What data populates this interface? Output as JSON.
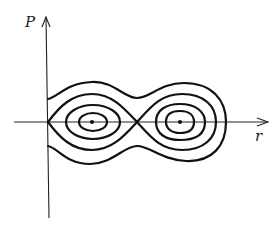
{
  "diagram": {
    "type": "phase-portrait",
    "axes": {
      "vertical_label": "P",
      "horizontal_label": "r"
    },
    "equilibria": [
      {
        "kind": "center",
        "position": "left"
      },
      {
        "kind": "center",
        "position": "right"
      },
      {
        "kind": "saddle",
        "position": "middle"
      }
    ],
    "curves": [
      {
        "name": "outer-orbit"
      },
      {
        "name": "separatrix"
      },
      {
        "name": "left-inner-orbit-1"
      },
      {
        "name": "left-inner-orbit-2"
      },
      {
        "name": "right-inner-orbit-1"
      },
      {
        "name": "right-inner-orbit-2"
      }
    ],
    "colors": {
      "ink": "#111111",
      "background": "#ffffff"
    }
  }
}
